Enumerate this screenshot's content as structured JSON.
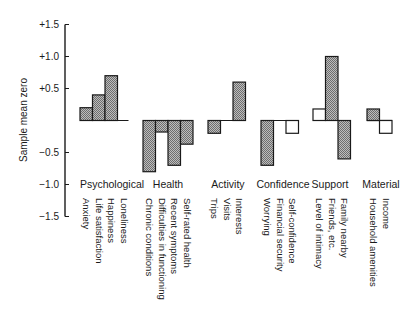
{
  "chart_data": {
    "type": "bar",
    "title": "",
    "xlabel": "",
    "ylabel": "Sample mean zero",
    "ylim": [
      -1.5,
      1.5
    ],
    "yticks": [
      "+1.5",
      "+1.0",
      "+0.5",
      "-0.5",
      "-1.0",
      "-1.5"
    ],
    "ytick_values": [
      1.5,
      1.0,
      0.5,
      -0.5,
      -1.0,
      -1.5
    ],
    "grid": false,
    "legend": null,
    "groups": [
      {
        "name": "Psychological",
        "items": [
          {
            "label": "Anxiety",
            "value": 0.2,
            "fill": "hatched"
          },
          {
            "label": "Life satisfaction",
            "value": 0.4,
            "fill": "hatched"
          },
          {
            "label": "Happiness",
            "value": 0.7,
            "fill": "hatched"
          },
          {
            "label": "Loneliness",
            "value": 0.0,
            "fill": "none"
          }
        ]
      },
      {
        "name": "Health",
        "items": [
          {
            "label": "Chronic conditions",
            "value": -0.8,
            "fill": "hatched"
          },
          {
            "label": "Difficulties in functioning",
            "value": -0.18,
            "fill": "hatched"
          },
          {
            "label": "Recent symptoms",
            "value": -0.7,
            "fill": "hatched"
          },
          {
            "label": "Self-rated health",
            "value": -0.37,
            "fill": "hatched"
          }
        ]
      },
      {
        "name": "Activity",
        "items": [
          {
            "label": "Trips",
            "value": -0.2,
            "fill": "hatched"
          },
          {
            "label": "Visits",
            "value": 0.0,
            "fill": "none"
          },
          {
            "label": "Interests",
            "value": 0.6,
            "fill": "hatched"
          }
        ]
      },
      {
        "name": "Confidence",
        "items": [
          {
            "label": "Worrying",
            "value": -0.7,
            "fill": "hatched"
          },
          {
            "label": "Financial security",
            "value": 0.0,
            "fill": "none"
          },
          {
            "label": "Self-confidence",
            "value": -0.2,
            "fill": "white"
          }
        ]
      },
      {
        "name": "Support",
        "items": [
          {
            "label": "Level of intimacy",
            "value": 0.18,
            "fill": "white"
          },
          {
            "label": "Friends, etc.",
            "value": 1.0,
            "fill": "hatched"
          },
          {
            "label": "Family nearby",
            "value": -0.6,
            "fill": "hatched"
          }
        ]
      },
      {
        "name": "Material",
        "items": [
          {
            "label": "Household amenities",
            "value": 0.18,
            "fill": "hatched"
          },
          {
            "label": "Income",
            "value": -0.2,
            "fill": "white"
          }
        ]
      }
    ]
  },
  "colors": {
    "ink": "#1a1a1a",
    "hatch_fill": "#9a9a9a",
    "white_fill": "#ffffff"
  }
}
